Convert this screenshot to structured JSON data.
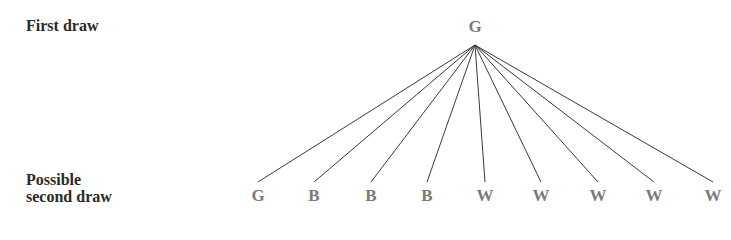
{
  "labels": {
    "first_draw": "First draw",
    "second_draw_line1": "Possible",
    "second_draw_line2": "second draw"
  },
  "root": {
    "label": "G",
    "x": 475,
    "label_y": 18,
    "apex_y": 45
  },
  "children": [
    {
      "label": "G",
      "x": 258
    },
    {
      "label": "B",
      "x": 314
    },
    {
      "label": "B",
      "x": 371
    },
    {
      "label": "B",
      "x": 427
    },
    {
      "label": "W",
      "x": 485
    },
    {
      "label": "W",
      "x": 541
    },
    {
      "label": "W",
      "x": 598
    },
    {
      "label": "W",
      "x": 654
    },
    {
      "label": "W",
      "x": 713
    }
  ],
  "geometry": {
    "line_end_y": 182,
    "child_label_top": 187
  },
  "colors": {
    "node_text": "#7a7a7a",
    "label_text": "#2a2a2a",
    "edge": "#3a3a3a"
  }
}
